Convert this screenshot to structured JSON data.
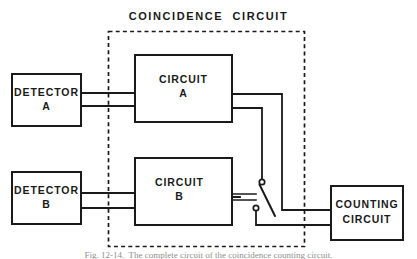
{
  "figure": {
    "title": "COINCIDENCE  CIRCUIT",
    "caption": "Fig. 12-14.  The complete circuit of the coincidence counting circuit."
  },
  "blocks": {
    "detector_a": {
      "line1": "DETECTOR",
      "line2": "A"
    },
    "detector_b": {
      "line1": "DETECTOR",
      "line2": "B"
    },
    "circuit_a": {
      "line1": "CIRCUIT",
      "line2": "A"
    },
    "circuit_b": {
      "line1": "CIRCUIT",
      "line2": "B"
    },
    "counting_circuit": {
      "line1": "COUNTING",
      "line2": "CIRCUIT"
    }
  },
  "colors": {
    "ink": "#1a1a1a",
    "paper": "#ffffff",
    "caption": "#8f8f8f"
  },
  "icons": {
    "switch": "relay-switch-icon",
    "arrow": "left-arrow-icon",
    "boundary": "dashed-boundary-icon"
  }
}
